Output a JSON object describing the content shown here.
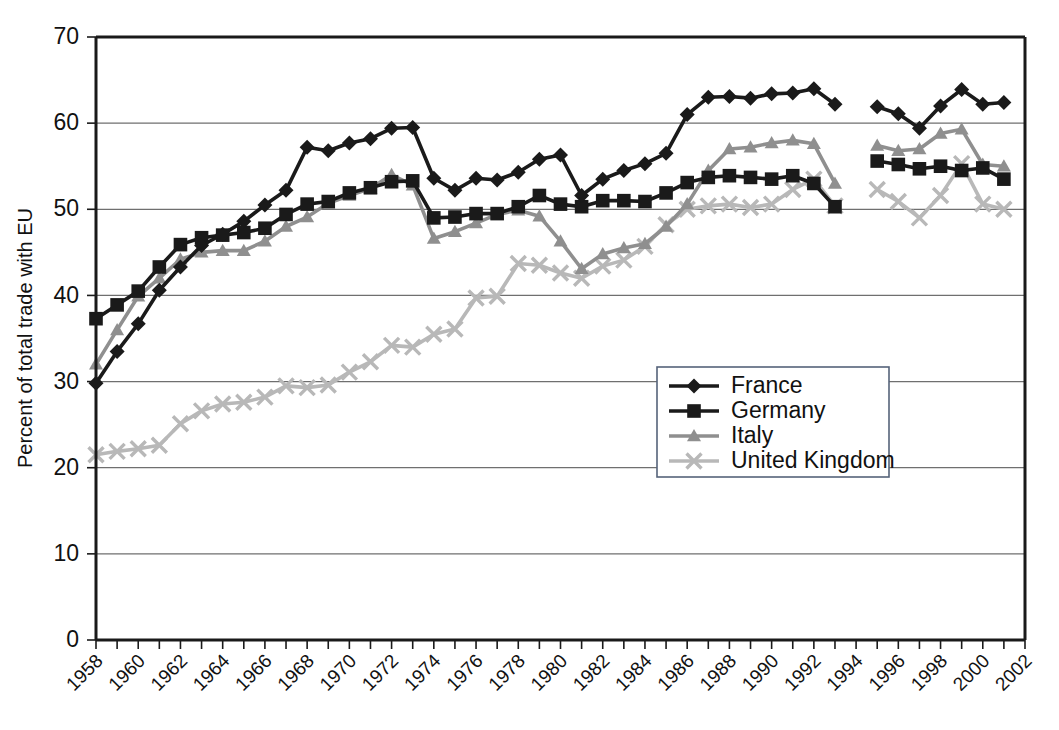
{
  "chart_data": {
    "type": "line",
    "title": "",
    "xlabel": "",
    "ylabel": "Percent of total trade with EU",
    "xlim": [
      1958,
      2002
    ],
    "ylim": [
      0,
      70
    ],
    "ytick_step": 10,
    "xtick_label_step": 2,
    "grid": true,
    "legend_position": "center-right",
    "yticks": [
      "0",
      "10",
      "20",
      "30",
      "40",
      "50",
      "60",
      "70"
    ],
    "xticks": [
      "1958",
      "1960",
      "1962",
      "1964",
      "1966",
      "1968",
      "1970",
      "1972",
      "1974",
      "1976",
      "1978",
      "1980",
      "1982",
      "1984",
      "1986",
      "1988",
      "1990",
      "1992",
      "1994",
      "1996",
      "1998",
      "2000",
      "2002"
    ],
    "x": [
      1958,
      1959,
      1960,
      1961,
      1962,
      1963,
      1964,
      1965,
      1966,
      1967,
      1968,
      1969,
      1970,
      1971,
      1972,
      1973,
      1974,
      1975,
      1976,
      1977,
      1978,
      1979,
      1980,
      1981,
      1982,
      1983,
      1984,
      1985,
      1986,
      1987,
      1988,
      1989,
      1990,
      1991,
      1992,
      1993,
      1994,
      1995,
      1996,
      1997,
      1998,
      1999,
      2000,
      2001
    ],
    "series": [
      {
        "name": "France",
        "color": "#1a1a1a",
        "marker": "diamond",
        "values": [
          29.8,
          33.5,
          36.7,
          40.6,
          43.3,
          45.8,
          47.1,
          48.6,
          50.5,
          52.2,
          57.2,
          56.8,
          57.7,
          58.2,
          59.4,
          59.5,
          53.6,
          52.2,
          53.6,
          53.4,
          54.3,
          55.8,
          56.3,
          51.6,
          53.5,
          54.5,
          55.3,
          56.5,
          61.0,
          63.0,
          63.1,
          62.9,
          63.4,
          63.5,
          64.0,
          62.2,
          null,
          61.9,
          61.1,
          59.4,
          62.0,
          63.9,
          62.2,
          62.4
        ]
      },
      {
        "name": "Germany",
        "color": "#1a1a1a",
        "marker": "square",
        "values": [
          37.3,
          38.9,
          40.5,
          43.3,
          45.9,
          46.7,
          47.0,
          47.3,
          47.8,
          49.4,
          50.6,
          50.9,
          51.9,
          52.5,
          53.2,
          53.3,
          49.0,
          49.1,
          49.5,
          49.5,
          50.3,
          51.6,
          50.6,
          50.3,
          51.0,
          51.0,
          50.9,
          51.9,
          53.1,
          53.7,
          53.9,
          53.7,
          53.5,
          53.9,
          53.0,
          50.3,
          null,
          55.6,
          55.2,
          54.7,
          55.0,
          54.5,
          54.8,
          53.5
        ]
      },
      {
        "name": "Italy",
        "color": "#8f8f8f",
        "marker": "triangle",
        "values": [
          32.0,
          36.0,
          39.9,
          42.0,
          44.2,
          45.0,
          45.2,
          45.2,
          46.3,
          48.0,
          49.1,
          50.7,
          51.6,
          52.4,
          54.0,
          52.8,
          46.6,
          47.4,
          48.4,
          49.4,
          49.9,
          49.2,
          46.3,
          43.1,
          44.8,
          45.5,
          46.0,
          48.0,
          50.6,
          54.5,
          57.0,
          57.2,
          57.7,
          58.0,
          57.6,
          53.0,
          null,
          57.4,
          56.8,
          57.0,
          58.8,
          59.3,
          55.2,
          55.0
        ]
      },
      {
        "name": "United Kingdom",
        "color": "#b8b8b8",
        "marker": "x",
        "values": [
          21.5,
          21.9,
          22.2,
          22.6,
          25.1,
          26.6,
          27.4,
          27.6,
          28.2,
          29.5,
          29.3,
          29.6,
          31.1,
          32.3,
          34.2,
          34.0,
          35.5,
          36.1,
          39.7,
          39.9,
          43.7,
          43.5,
          42.6,
          42.0,
          43.4,
          44.1,
          45.7,
          48.2,
          50.0,
          50.4,
          50.6,
          50.2,
          50.6,
          52.3,
          53.5,
          50.4,
          null,
          52.3,
          50.9,
          49.0,
          51.6,
          55.3,
          50.6,
          50.0
        ]
      }
    ]
  },
  "legend": {
    "entries": [
      {
        "label": "France"
      },
      {
        "label": "Germany"
      },
      {
        "label": "Italy"
      },
      {
        "label": "United Kingdom"
      }
    ]
  }
}
